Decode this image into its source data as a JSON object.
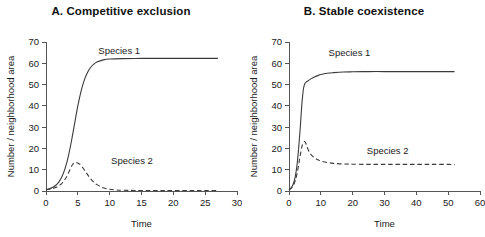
{
  "figure": {
    "background": "#ffffff",
    "line_color": "#3b3b3b",
    "axis_color": "#555555"
  },
  "panels": [
    {
      "id": "A",
      "title": "A. Competitive exclusion",
      "xlabel": "Time",
      "ylabel": "Number / neighborhood area",
      "series1_label": "Species 1",
      "series2_label": "Species 2"
    },
    {
      "id": "B",
      "title": "B. Stable coexistence",
      "xlabel": "Time",
      "ylabel": "Number / neighborhood area",
      "series1_label": "Species 1",
      "series2_label": "Species 2"
    }
  ],
  "chart_data": [
    {
      "type": "line",
      "panel": "A",
      "title": "A. Competitive exclusion",
      "xlabel": "Time",
      "ylabel": "Number / neighborhood area",
      "xlim": [
        0,
        30
      ],
      "ylim": [
        0,
        70
      ],
      "xticks": [
        0,
        5,
        10,
        15,
        20,
        25,
        30
      ],
      "yticks": [
        0,
        10,
        20,
        30,
        40,
        50,
        60,
        70
      ],
      "grid": false,
      "legend": "inline-annotation",
      "series": [
        {
          "name": "Species 1",
          "style": "solid",
          "label_x": 11.5,
          "label_y": 66,
          "x": [
            0,
            0.5,
            1,
            1.5,
            2,
            2.5,
            3,
            3.5,
            4,
            4.5,
            5,
            5.5,
            6,
            6.5,
            7,
            7.5,
            8,
            9,
            10,
            12,
            15,
            18,
            21,
            24,
            27
          ],
          "y": [
            0.6,
            1.0,
            1.6,
            2.6,
            4.2,
            6.7,
            10.6,
            16.2,
            23.5,
            31.8,
            40.0,
            46.8,
            52.0,
            55.6,
            58.0,
            59.6,
            60.6,
            61.6,
            62.0,
            62.2,
            62.3,
            62.3,
            62.3,
            62.3,
            62.3
          ]
        },
        {
          "name": "Species 2",
          "style": "dashed",
          "label_x": 13.5,
          "label_y": 14.5,
          "x": [
            0,
            0.5,
            1,
            1.5,
            2,
            2.5,
            3,
            3.5,
            4,
            4.3,
            4.6,
            5,
            5.5,
            6,
            6.5,
            7,
            7.5,
            8,
            9,
            10,
            11,
            12,
            14,
            17,
            20,
            24,
            27
          ],
          "y": [
            0.6,
            0.8,
            1.1,
            1.6,
            2.4,
            3.6,
            5.5,
            8.3,
            11.6,
            12.9,
            13.3,
            13.2,
            12.0,
            10.0,
            7.8,
            5.8,
            4.2,
            3.0,
            1.5,
            0.8,
            0.5,
            0.35,
            0.25,
            0.2,
            0.2,
            0.2,
            0.2
          ]
        }
      ]
    },
    {
      "type": "line",
      "panel": "B",
      "title": "B. Stable coexistence",
      "xlabel": "Time",
      "ylabel": "Number / neighborhood area",
      "xlim": [
        0,
        60
      ],
      "ylim": [
        0,
        70
      ],
      "xticks": [
        0,
        10,
        20,
        30,
        40,
        50,
        60
      ],
      "yticks": [
        0,
        10,
        20,
        30,
        40,
        50,
        60,
        70
      ],
      "grid": false,
      "legend": "inline-annotation",
      "series": [
        {
          "name": "Species 1",
          "style": "solid",
          "label_x": 19,
          "label_y": 65,
          "x": [
            0,
            0.5,
            1,
            1.5,
            2,
            2.5,
            3,
            3.5,
            4,
            4.3,
            4.6,
            5,
            5.5,
            6,
            7,
            8,
            9,
            10,
            12,
            14,
            17,
            20,
            25,
            30,
            35,
            40,
            45,
            50,
            52
          ],
          "y": [
            0.6,
            1.2,
            2.2,
            4.0,
            7.0,
            12.0,
            19.5,
            29.0,
            40.0,
            45.0,
            48.5,
            50.5,
            51.3,
            51.8,
            52.8,
            53.6,
            54.2,
            54.7,
            55.3,
            55.6,
            55.9,
            56.0,
            56.1,
            56.1,
            56.1,
            56.1,
            56.1,
            56.1,
            56.1
          ]
        },
        {
          "name": "Species 2",
          "style": "dashed",
          "label_x": 31,
          "label_y": 19,
          "x": [
            0,
            0.5,
            1,
            1.5,
            2,
            2.5,
            3,
            3.5,
            4,
            4.3,
            4.6,
            5,
            5.3,
            5.6,
            6,
            6.5,
            7,
            8,
            9,
            10,
            12,
            14,
            17,
            20,
            25,
            30,
            35,
            40,
            45,
            50,
            52
          ],
          "y": [
            0.6,
            1.0,
            1.8,
            3.0,
            5.0,
            8.0,
            12.0,
            16.5,
            20.5,
            22.0,
            22.9,
            23.2,
            22.3,
            21.0,
            19.5,
            18.0,
            17.0,
            15.6,
            14.7,
            14.1,
            13.4,
            13.0,
            12.7,
            12.6,
            12.5,
            12.5,
            12.5,
            12.5,
            12.5,
            12.5,
            12.4
          ]
        }
      ]
    }
  ]
}
